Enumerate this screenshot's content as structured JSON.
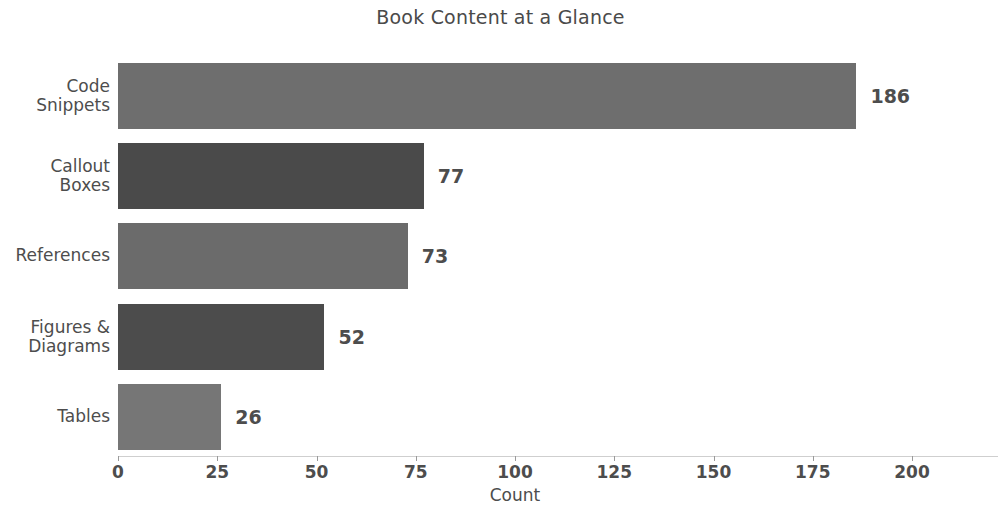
{
  "chart_data": {
    "type": "bar",
    "orientation": "horizontal",
    "title": "Book Content at a Glance",
    "xlabel": "Count",
    "ylabel": "",
    "categories": [
      "Code Snippets",
      "Callout Boxes",
      "References",
      "Figures & Diagrams",
      "Tables"
    ],
    "values": [
      186,
      77,
      73,
      52,
      26
    ],
    "value_labels": [
      "186",
      "77",
      "73",
      "52",
      "26"
    ],
    "bar_colors": [
      "#6e6e6e",
      "#4a4a4a",
      "#6b6b6b",
      "#4c4c4c",
      "#767676"
    ],
    "xlim": [
      0,
      214
    ],
    "xticks": [
      0,
      25,
      50,
      75,
      100,
      125,
      150,
      175,
      200
    ],
    "xtick_labels": [
      "0",
      "25",
      "50",
      "75",
      "100",
      "125",
      "150",
      "175",
      "200"
    ],
    "grid": false,
    "legend": false,
    "background_color": "#ffffff",
    "text_color": "#4d4d4d"
  },
  "figure": {
    "title": "Book Content at a Glance",
    "x_axis_label": "Count"
  }
}
